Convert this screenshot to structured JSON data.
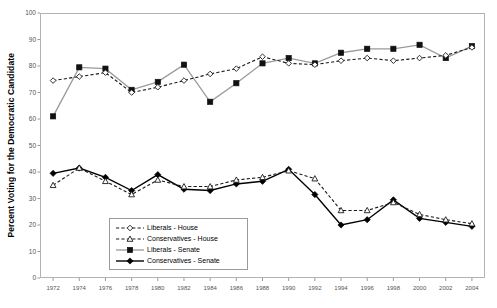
{
  "chart_data": {
    "type": "line",
    "title": "",
    "xlabel": "",
    "ylabel": "Percent Voting for the Democratic Candidate",
    "ylim": [
      0,
      100
    ],
    "ytick_step": 10,
    "yticks": [
      0,
      10,
      20,
      30,
      40,
      50,
      60,
      70,
      80,
      90,
      100
    ],
    "grid": false,
    "legend_position": "bottom-center",
    "categories": [
      1972,
      1974,
      1976,
      1978,
      1980,
      1982,
      1984,
      1986,
      1988,
      1990,
      1992,
      1994,
      1996,
      1998,
      2000,
      2002,
      2004
    ],
    "series": [
      {
        "name": "Liberals - House",
        "marker": "open-diamond",
        "line": "dashed",
        "color": "#1a1a1a",
        "values": [
          74.5,
          76,
          77.5,
          70,
          72,
          74.5,
          77,
          79,
          83.5,
          81,
          80.5,
          82,
          83,
          82,
          83,
          84,
          87
        ]
      },
      {
        "name": "Conservatives - House",
        "marker": "open-triangle",
        "line": "dashed",
        "color": "#1a1a1a",
        "values": [
          35,
          41.5,
          36.5,
          31.5,
          37,
          34.5,
          34.5,
          37,
          38,
          40.5,
          37.5,
          25.5,
          25.5,
          28.5,
          24,
          22,
          20.5
        ]
      },
      {
        "name": "Liberals - Senate",
        "marker": "filled-square",
        "line": "solid",
        "color": "#9a9a9a",
        "values": [
          61,
          79.5,
          79,
          71,
          74,
          80.5,
          66.5,
          73.5,
          81,
          83,
          81,
          85,
          86.5,
          86.5,
          88,
          83,
          87.5
        ]
      },
      {
        "name": "Conservatives - Senate",
        "marker": "filled-diamond",
        "line": "solid",
        "color": "#000000",
        "values": [
          39.5,
          41.5,
          38,
          33,
          39,
          33.5,
          33,
          35.5,
          36.5,
          41,
          31.5,
          20,
          22,
          29.5,
          22.5,
          21,
          19.5
        ]
      }
    ]
  }
}
